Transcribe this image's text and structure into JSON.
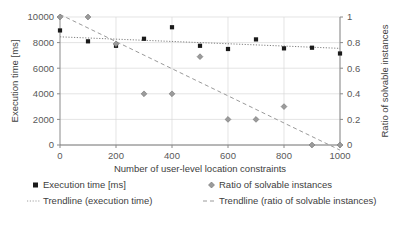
{
  "chart_data": {
    "type": "scatter",
    "title": "",
    "xlabel": "Number of user-level location constraints",
    "ylabel": "Execution time [ms]",
    "y2label": "Ratio of solvable instances",
    "xlim": [
      0,
      1000
    ],
    "ylim": [
      0,
      10000
    ],
    "y2lim": [
      0,
      1
    ],
    "grid": true,
    "legend_position": "bottom",
    "xticks": [
      "0",
      "200",
      "400",
      "600",
      "800",
      "1000"
    ],
    "xtick_values": [
      0,
      200,
      400,
      600,
      800,
      1000
    ],
    "yticks": [
      "0",
      "2000",
      "4000",
      "6000",
      "8000",
      "10000"
    ],
    "ytick_values": [
      0,
      2000,
      4000,
      6000,
      8000,
      10000
    ],
    "y2ticks": [
      "0",
      "0.2",
      "0.4",
      "0.6",
      "0.8",
      "1"
    ],
    "y2tick_values": [
      0,
      0.2,
      0.4,
      0.6,
      0.8,
      1
    ],
    "x": [
      0,
      100,
      200,
      300,
      400,
      500,
      600,
      700,
      800,
      900,
      1000
    ],
    "series": [
      {
        "name": "Execution time [ms]",
        "axis": "left",
        "marker": "square",
        "color": "#1a1a1a",
        "values": [
          8950,
          8100,
          7750,
          8300,
          9200,
          7750,
          7500,
          8250,
          7550,
          7600,
          7150
        ]
      },
      {
        "name": "Ratio of solvable instances",
        "axis": "right",
        "marker": "diamond",
        "color": "#808080",
        "values": [
          1.0,
          1.0,
          0.79,
          0.4,
          0.4,
          0.69,
          0.2,
          0.2,
          0.3,
          0.0,
          0.0
        ]
      }
    ],
    "trendlines": [
      {
        "name": "Trendline (execution time)",
        "axis": "left",
        "style": "dotted",
        "color": "#808080",
        "x_start": 0,
        "y_start": 8450,
        "x_end": 1000,
        "y_end": 7550
      },
      {
        "name": "Trendline (ratio of solvable instances)",
        "axis": "right",
        "style": "dashed",
        "color": "#9a9a9a",
        "x_start": 0,
        "y_start": 1.02,
        "x_end": 1000,
        "y_end": -0.04
      }
    ]
  },
  "legend": {
    "items": [
      {
        "label": "Execution time [ms]",
        "glyph": "square-marker"
      },
      {
        "label": "Ratio of solvable instances",
        "glyph": "diamond-marker"
      },
      {
        "label": "Trendline (execution time)",
        "glyph": "dotted-line"
      },
      {
        "label": "Trendline (ratio of solvable instances)",
        "glyph": "dashed-line"
      }
    ]
  }
}
